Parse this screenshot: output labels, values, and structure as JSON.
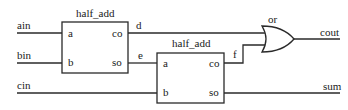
{
  "diagram": {
    "type": "full_adder_schematic",
    "inputs": [
      {
        "name": "ain"
      },
      {
        "name": "bin"
      },
      {
        "name": "cin"
      }
    ],
    "outputs": [
      {
        "name": "cout"
      },
      {
        "name": "sum"
      }
    ],
    "modules": [
      {
        "title": "half_add",
        "ports_in": [
          "a",
          "b"
        ],
        "ports_out": [
          "co",
          "so"
        ]
      },
      {
        "title": "half_add",
        "ports_in": [
          "a",
          "b"
        ],
        "ports_out": [
          "co",
          "so"
        ]
      }
    ],
    "gates": [
      {
        "type": "or",
        "label": "or"
      }
    ],
    "nets": [
      {
        "name": "d"
      },
      {
        "name": "e"
      },
      {
        "name": "f"
      }
    ]
  }
}
